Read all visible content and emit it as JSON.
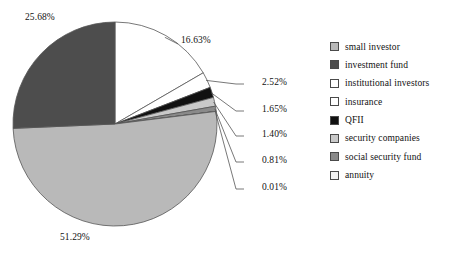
{
  "chart_data": {
    "type": "pie",
    "title": "",
    "labels": [
      "small investor",
      "investment fund",
      "institutional investors",
      "insurance",
      "QFII",
      "security companies",
      "social security fund",
      "annuity"
    ],
    "values": [
      51.29,
      25.68,
      16.63,
      2.52,
      1.65,
      1.4,
      0.81,
      0.01
    ],
    "value_labels": [
      "51.29%",
      "25.68%",
      "16.63%",
      "2.52%",
      "1.65%",
      "1.40%",
      "0.81%",
      "0.01%"
    ],
    "colors": [
      "#b9b9b9",
      "#4d4d4d",
      "#ffffff",
      "#ffffff",
      "#111111",
      "#c9c9c9",
      "#8a8a8a",
      "#f2f2f2"
    ],
    "start_angle_deg": 0,
    "direction": "clockwise",
    "draw_order": [
      "institutional investors",
      "insurance",
      "QFII",
      "security companies",
      "social security fund",
      "annuity",
      "small investor",
      "investment fund"
    ],
    "legend_position": "right",
    "grid": false,
    "stroke_color": "#555555"
  },
  "labels": {
    "institutional_investors": "16.63%",
    "insurance": "2.52%",
    "qfii": "1.65%",
    "security_companies": "1.40%",
    "social_security_fund": "0.81%",
    "annuity": "0.01%",
    "small_investor": "51.29%",
    "investment_fund": "25.68%"
  },
  "legend": {
    "items": [
      {
        "label": "small investor",
        "color": "#b9b9b9"
      },
      {
        "label": "investment fund",
        "color": "#4d4d4d"
      },
      {
        "label": "institutional investors",
        "color": "#ffffff"
      },
      {
        "label": "insurance",
        "color": "#ffffff"
      },
      {
        "label": "QFII",
        "color": "#111111"
      },
      {
        "label": "security companies",
        "color": "#c9c9c9"
      },
      {
        "label": "social security fund",
        "color": "#8a8a8a"
      },
      {
        "label": "annuity",
        "color": "#f2f2f2"
      }
    ]
  }
}
